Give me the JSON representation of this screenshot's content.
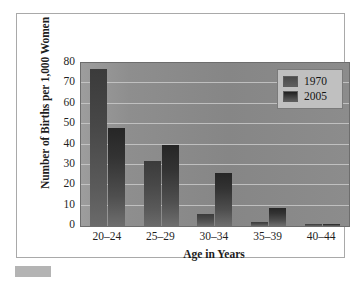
{
  "chart_data": {
    "type": "bar",
    "title": "",
    "xlabel": "Age in Years",
    "ylabel": "Number of Births per 1,000 Women",
    "categories": [
      "20–24",
      "25–29",
      "30–34",
      "35–39",
      "40–44"
    ],
    "series": [
      {
        "name": "1970",
        "values": [
          77,
          32,
          6,
          2,
          1
        ]
      },
      {
        "name": "2005",
        "values": [
          48,
          40,
          26,
          9,
          1
        ]
      }
    ],
    "ylim": [
      0,
      80
    ],
    "yticks": [
      0,
      10,
      20,
      30,
      40,
      50,
      60,
      70,
      80
    ],
    "ytick_labels": [
      "0",
      "10",
      "20",
      "30",
      "40",
      "50",
      "60",
      "70",
      "80"
    ],
    "grid": true,
    "legend_position": "top-right",
    "legend_entries": [
      "1970",
      "2005"
    ],
    "colors": {
      "series_1970": "#4a4a4a",
      "series_2005": "#262626",
      "plot_background": "#8e8e8e",
      "gridline": "#c9c9c9",
      "frame_border": "#a9a9a9",
      "legend_background": "#c0c0c0",
      "footer_mark": "#b4b4b4"
    }
  }
}
